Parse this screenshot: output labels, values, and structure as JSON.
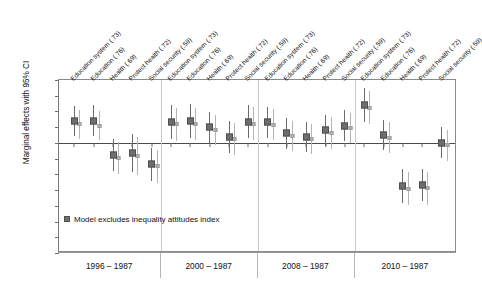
{
  "chart_data": {
    "type": "scatter",
    "title": "",
    "subtitle": "",
    "xlabel": "",
    "ylabel": "Marginal effects with 95% CI",
    "ylim": [
      -0.35,
      0.2
    ],
    "ytick_values": [
      0.2,
      0.15,
      0.1,
      0.05,
      0.0,
      -0.05,
      -0.1,
      -0.15,
      -0.2,
      -0.25,
      -0.3,
      -0.35
    ],
    "ytick_labels": [
      "0.20",
      "0.15",
      "0.10",
      "0.05",
      "0.00",
      "-0.05",
      "-0.10",
      "-0.15",
      "-0.20",
      "-0.25",
      "-0.30",
      "-0.35"
    ],
    "grid": false,
    "zero_reference_line": 0.0,
    "legend_position": "inside-lower-left",
    "legend_entries": [
      {
        "label": "Model excludes inequality attitudes index",
        "marker": "square",
        "color": "#6e6e6e"
      }
    ],
    "series": [
      {
        "name": "Model excludes inequality attitudes index",
        "marker": "square-dark",
        "color": "#6e6e6e",
        "values": [
          0.07,
          0.071,
          -0.038,
          -0.032,
          -0.068,
          0.066,
          0.07,
          0.049,
          0.02,
          0.068,
          0.066,
          0.03,
          0.019,
          0.04,
          0.055,
          0.122,
          0.025,
          -0.136,
          -0.135,
          0.001
        ],
        "ci_low": [
          0.021,
          0.022,
          -0.089,
          -0.093,
          -0.12,
          0.013,
          0.017,
          0.0,
          -0.031,
          0.015,
          0.017,
          -0.018,
          -0.028,
          -0.01,
          0.006,
          0.068,
          -0.024,
          -0.19,
          -0.186,
          -0.048
        ],
        "ci_high": [
          0.118,
          0.12,
          0.013,
          0.029,
          -0.017,
          0.119,
          0.123,
          0.098,
          0.07,
          0.122,
          0.115,
          0.078,
          0.066,
          0.09,
          0.104,
          0.176,
          0.074,
          -0.082,
          -0.084,
          0.05
        ]
      },
      {
        "name": "Full model",
        "marker": "square-light",
        "color": "#b0b0b0",
        "values": [
          0.059,
          0.055,
          -0.047,
          -0.042,
          -0.073,
          0.059,
          0.06,
          0.041,
          0.011,
          0.061,
          0.058,
          0.023,
          0.012,
          0.032,
          0.048,
          0.112,
          0.017,
          -0.145,
          -0.144,
          -0.008
        ],
        "ci_low": [
          0.012,
          0.008,
          -0.098,
          -0.102,
          -0.126,
          0.007,
          0.009,
          -0.007,
          -0.04,
          0.009,
          0.01,
          -0.025,
          -0.036,
          -0.018,
          -0.001,
          0.059,
          -0.032,
          -0.198,
          -0.196,
          -0.057
        ],
        "ci_high": [
          0.106,
          0.103,
          0.004,
          0.018,
          -0.021,
          0.111,
          0.112,
          0.089,
          0.062,
          0.114,
          0.107,
          0.07,
          0.059,
          0.082,
          0.096,
          0.165,
          0.066,
          -0.091,
          -0.092,
          0.041
        ]
      }
    ],
    "categories": [
      "Education system (.73)",
      "Education  (.76)",
      "Health (.69)",
      "Protect health (.72)",
      "Social security (.59)",
      "Education system (.73)",
      "Education  (.76)",
      "Health (.69)",
      "Protect health (.72)",
      "Social security (.59)",
      "Education system (.73)",
      "Education  (.76)",
      "Health (.69)",
      "Protect health (.72)",
      "Social security (.59)",
      "Education system (.73)",
      "Education  (.76)",
      "Health (.69)",
      "Protect health (.72)",
      "Social security (.59)"
    ],
    "groups": [
      {
        "label": "1996 – 1987",
        "n_categories": 5
      },
      {
        "label": "2000 – 1987",
        "n_categories": 5
      },
      {
        "label": "2008 – 1987",
        "n_categories": 5
      },
      {
        "label": "2010 – 1987",
        "n_categories": 5
      }
    ]
  }
}
